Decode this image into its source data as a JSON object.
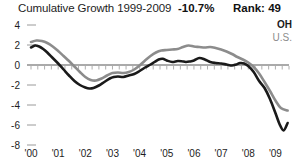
{
  "header": {
    "title": "Cumulative Growth 1999-2009",
    "growth_value": "-10.7%",
    "rank_value": "Rank: 49"
  },
  "legend": {
    "position": "top-right",
    "entries": [
      {
        "label": "OH",
        "color": "#1a1a1a",
        "emphasis": "bold"
      },
      {
        "label": "U.S.",
        "color": "#8c8c8c",
        "emphasis": "normal"
      }
    ]
  },
  "colors": {
    "oh_line": "#1a1a1a",
    "us_line": "#8c8c8c",
    "axis": "#8e8e8e",
    "tick": "#9a9a9a",
    "text": "#1d1d1d",
    "background": "#ffffff"
  },
  "chart_data": {
    "type": "line",
    "title": "Cumulative Growth 1999-2009",
    "xlabel": "",
    "ylabel": "",
    "xlim": [
      2000,
      2009.5
    ],
    "ylim": [
      -8,
      4
    ],
    "yticks": [
      4,
      2,
      0,
      -2,
      -4,
      -6,
      -8
    ],
    "ytick_labels": [
      "4",
      "2",
      "0",
      "-2",
      "-4",
      "-6",
      "-8"
    ],
    "xticks": [
      2000,
      2001,
      2002,
      2003,
      2004,
      2005,
      2006,
      2007,
      2008,
      2009
    ],
    "xtick_labels": [
      "'00",
      "'01",
      "'02",
      "'03",
      "'04",
      "'05",
      "'06",
      "'07",
      "'08",
      "'09"
    ],
    "grid": false,
    "zero_line": true,
    "legend_position": "top-right",
    "annotations": [
      {
        "text": "-10.7%",
        "role": "summary-value"
      },
      {
        "text": "Rank: 49",
        "role": "summary-rank"
      }
    ],
    "series": [
      {
        "name": "OH",
        "color": "#1a1a1a",
        "width": 2.6,
        "x": [
          2000.0,
          2000.15,
          2000.3,
          2000.45,
          2000.6,
          2000.8,
          2001.0,
          2001.2,
          2001.4,
          2001.6,
          2001.8,
          2002.0,
          2002.15,
          2002.3,
          2002.5,
          2002.7,
          2002.9,
          2003.05,
          2003.2,
          2003.4,
          2003.6,
          2003.8,
          2004.0,
          2004.2,
          2004.4,
          2004.55,
          2004.7,
          2004.85,
          2005.0,
          2005.2,
          2005.4,
          2005.55,
          2005.7,
          2005.85,
          2006.0,
          2006.2,
          2006.4,
          2006.6,
          2006.8,
          2007.0,
          2007.2,
          2007.4,
          2007.55,
          2007.7,
          2007.85,
          2008.0,
          2008.2,
          2008.4,
          2008.6,
          2008.8,
          2009.0,
          2009.15,
          2009.3,
          2009.45
        ],
        "y": [
          1.75,
          1.95,
          1.85,
          1.6,
          1.25,
          0.7,
          0.15,
          -0.45,
          -1.05,
          -1.6,
          -2.0,
          -2.25,
          -2.35,
          -2.3,
          -2.05,
          -1.7,
          -1.35,
          -1.2,
          -1.15,
          -1.2,
          -1.05,
          -0.9,
          -0.6,
          -0.25,
          0.05,
          0.3,
          0.55,
          0.62,
          0.45,
          0.3,
          0.4,
          0.38,
          0.3,
          0.35,
          0.45,
          0.7,
          0.55,
          0.3,
          0.2,
          0.15,
          0.05,
          -0.05,
          0.05,
          0.2,
          0.15,
          -0.1,
          -0.7,
          -1.6,
          -2.3,
          -3.4,
          -4.8,
          -5.9,
          -6.55,
          -5.8
        ]
      },
      {
        "name": "U.S.",
        "color": "#8c8c8c",
        "width": 2.6,
        "x": [
          2000.0,
          2000.2,
          2000.4,
          2000.6,
          2000.8,
          2001.0,
          2001.2,
          2001.4,
          2001.6,
          2001.8,
          2002.0,
          2002.2,
          2002.4,
          2002.6,
          2002.8,
          2003.0,
          2003.2,
          2003.4,
          2003.6,
          2003.8,
          2004.0,
          2004.2,
          2004.4,
          2004.6,
          2004.8,
          2005.0,
          2005.2,
          2005.4,
          2005.6,
          2005.8,
          2006.0,
          2006.2,
          2006.4,
          2006.6,
          2006.8,
          2007.0,
          2007.2,
          2007.4,
          2007.6,
          2007.8,
          2008.0,
          2008.2,
          2008.4,
          2008.6,
          2008.8,
          2009.0,
          2009.2,
          2009.45
        ],
        "y": [
          2.3,
          2.45,
          2.4,
          2.2,
          1.85,
          1.4,
          0.9,
          0.4,
          -0.15,
          -0.7,
          -1.2,
          -1.5,
          -1.55,
          -1.35,
          -1.05,
          -0.8,
          -0.75,
          -0.8,
          -0.7,
          -0.45,
          -0.05,
          0.45,
          0.9,
          1.25,
          1.45,
          1.5,
          1.55,
          1.6,
          1.8,
          1.95,
          1.85,
          1.8,
          1.75,
          1.8,
          1.7,
          1.55,
          1.35,
          1.1,
          0.8,
          0.55,
          0.25,
          -0.2,
          -0.85,
          -1.7,
          -2.6,
          -3.55,
          -4.3,
          -4.55
        ]
      }
    ]
  }
}
